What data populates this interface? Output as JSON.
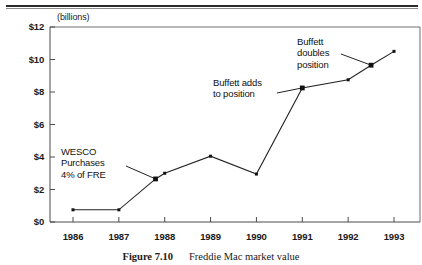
{
  "page": {
    "header_rule": "page-header-rule",
    "background": "#ffffff",
    "ink": "#111111"
  },
  "caption": {
    "number": "Figure 7.10",
    "text": "Freddie Mac market value"
  },
  "chart_data": {
    "type": "line",
    "title": "Freddie Mac market value",
    "xlabel": "",
    "ylabel": "",
    "units_note": "(billions)",
    "grid": false,
    "legend": "none",
    "xlim": [
      1985.6,
      1993.6
    ],
    "ylim": [
      0,
      12
    ],
    "categories": [
      "1986",
      "1987",
      "1988",
      "1989",
      "1990",
      "1991",
      "1992",
      "1993"
    ],
    "x_tick_labels": [
      "1986",
      "1987",
      "1988",
      "1989",
      "1990",
      "1991",
      "1992",
      "1993"
    ],
    "y_tick_labels": [
      "$0",
      "$2",
      "$4",
      "$6",
      "$8",
      "$10",
      "$12"
    ],
    "y_tick_values": [
      0,
      2,
      4,
      6,
      8,
      10,
      12
    ],
    "series": [
      {
        "name": "Freddie Mac market value",
        "color": "#232323",
        "marker": "square",
        "points": [
          {
            "x": 1986.0,
            "y": 0.75,
            "label": "1986"
          },
          {
            "x": 1987.0,
            "y": 0.75,
            "label": "1987"
          },
          {
            "x": 1987.8,
            "y": 2.65,
            "label": "WESCO purchase"
          },
          {
            "x": 1988.0,
            "y": 3.0,
            "label": "1988"
          },
          {
            "x": 1989.0,
            "y": 4.05,
            "label": "1989"
          },
          {
            "x": 1990.0,
            "y": 2.95,
            "label": "1990"
          },
          {
            "x": 1991.0,
            "y": 8.25,
            "label": "1991"
          },
          {
            "x": 1992.0,
            "y": 8.75,
            "label": "1992"
          },
          {
            "x": 1992.5,
            "y": 9.65,
            "label": "Buffett doubles"
          },
          {
            "x": 1993.0,
            "y": 10.5,
            "label": "1993"
          }
        ]
      }
    ],
    "annotations": [
      {
        "id": "wesco",
        "text": "WESCO\nPurchases\n4% of FRE",
        "align": "left",
        "target_x": 1987.8,
        "target_y": 2.65
      },
      {
        "id": "buffett-adds",
        "text": "Buffett adds\nto position",
        "align": "left",
        "target_x": 1991.0,
        "target_y": 8.25
      },
      {
        "id": "buffett-doubles",
        "text": "Buffett\ndoubles\nposition",
        "align": "left",
        "target_x": 1992.5,
        "target_y": 9.65
      }
    ]
  }
}
